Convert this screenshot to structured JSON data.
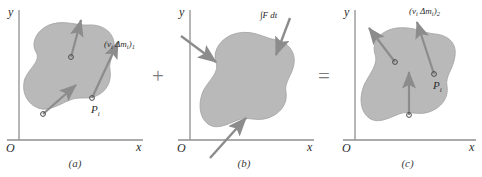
{
  "figure": {
    "background_color": "#ffffff",
    "blob_fill": "#b9b9b9",
    "blob_stroke": "#9a9a9a",
    "arrow_color": "#8c8c8c",
    "axis_color": "#8f8f8f",
    "text_color": "#2b2b2b"
  },
  "operators": {
    "plus": "+",
    "equals": "="
  },
  "axes": {
    "y_label": "y",
    "x_label": "x",
    "origin_label": "O"
  },
  "panels": [
    {
      "id": "a",
      "caption": "(a)",
      "vector_label": "(v",
      "vector_label_sub1": "i",
      "vector_label_mid": " Δm",
      "vector_label_sub2": "i",
      "vector_label_close": ")",
      "vector_label_sub3": "1",
      "vector_label_full": "(vᵢ Δmᵢ)₁",
      "point_label": "P",
      "point_label_sub": "i",
      "description": "Momentum of particles before impact"
    },
    {
      "id": "b",
      "caption": "(b)",
      "vector_label_full": "∫F dt",
      "integral_symbol": "∫",
      "force_symbol": "F",
      "differential": "dt",
      "description": "External impulse applied to body"
    },
    {
      "id": "c",
      "caption": "(c)",
      "vector_label": "(v",
      "vector_label_sub1": "i",
      "vector_label_mid": " Δm",
      "vector_label_sub2": "i",
      "vector_label_close": ")",
      "vector_label_sub3": "2",
      "vector_label_full": "(vᵢ Δmᵢ)₂",
      "point_label": "P",
      "point_label_sub": "i",
      "description": "Momentum of particles after impact"
    }
  ]
}
